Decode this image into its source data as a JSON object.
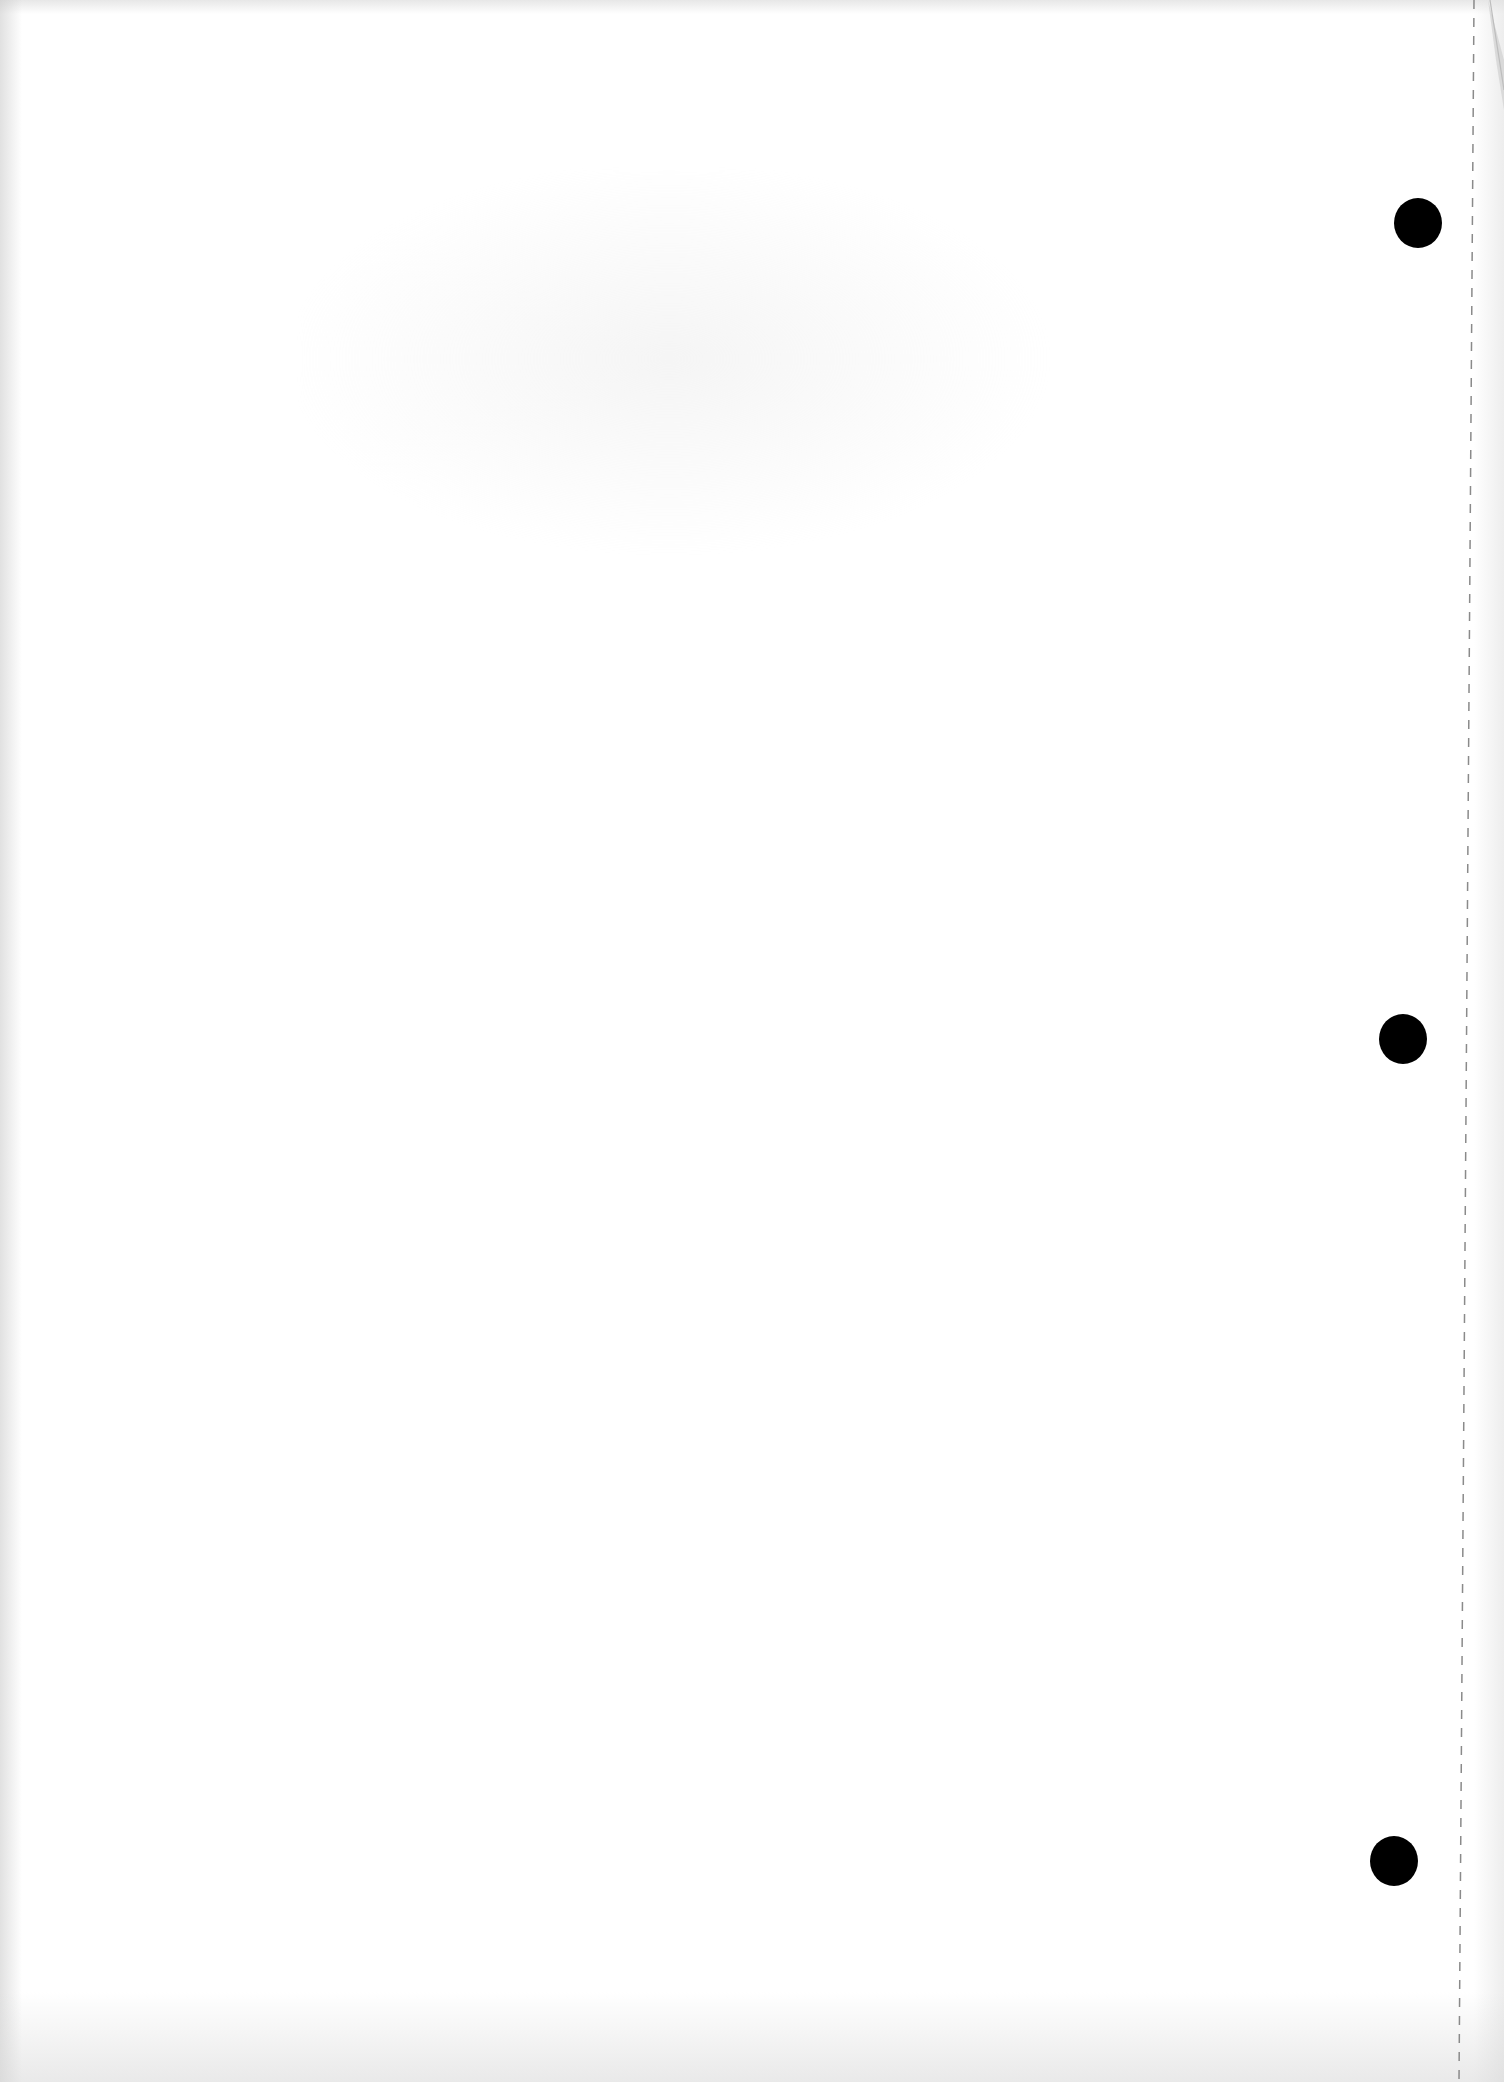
{
  "document": {
    "type": "blank scanned page",
    "text": "",
    "background_color": "#ffffff"
  },
  "punch_holes": [
    {
      "cx": 1418,
      "cy": 222,
      "r": 24,
      "color": "#000000"
    },
    {
      "cx": 1403,
      "cy": 1038,
      "r": 24,
      "color": "#000000"
    },
    {
      "cx": 1394,
      "cy": 1860,
      "r": 24,
      "color": "#000000"
    }
  ],
  "perforation": {
    "x_top": 1474,
    "x_bottom": 1459,
    "color": "#8a8a8a",
    "style": "dashed"
  },
  "corner_fold": {
    "position": "top-right",
    "color": "#c8c8c8"
  }
}
